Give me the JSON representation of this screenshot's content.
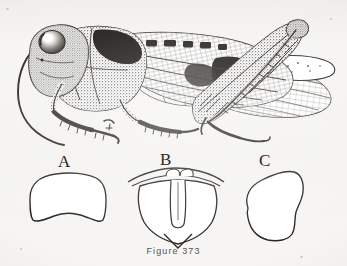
{
  "figure": {
    "caption": "Figure 373",
    "background_color": "#f4f3f1",
    "ink_color": "#231f1c"
  },
  "specimen": {
    "name": "grasshopper-lateral-view",
    "parts": [
      "antenna",
      "compound-eye",
      "head",
      "pronotum",
      "tegmen-forewing",
      "hind-wing",
      "hind-femur",
      "hind-tibia",
      "hind-tarsus",
      "fore-leg",
      "mid-leg",
      "abdomen"
    ]
  },
  "plates": [
    {
      "label": "A",
      "name": "plate-a",
      "description": "broad rounded plate with concave lower margin"
    },
    {
      "label": "B",
      "name": "plate-b",
      "description": "shield-shaped plate with arched top bar, paired lobes and deep median furcula slit ending in pointed apex"
    },
    {
      "label": "C",
      "name": "plate-c",
      "description": "irregular kidney-shaped plate notched on the right margin"
    }
  ]
}
